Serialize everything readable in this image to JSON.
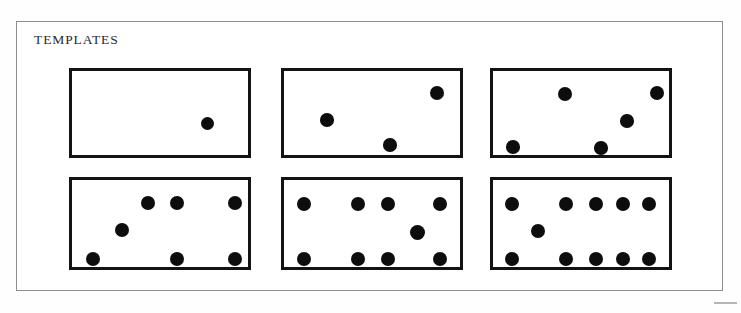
{
  "page": {
    "title": "TEMPLATES",
    "background_color": "#ffffff",
    "frame_color": "#8e8e8e",
    "card_border_color": "#131313",
    "dot_color": "#0d0d0d"
  },
  "templates": [
    {
      "id": "template-1",
      "name": "template-card-1-dot",
      "dot_count": "1",
      "rect": {
        "x": 69,
        "y": 68,
        "w": 182,
        "h": 90
      },
      "dots": [
        {
          "cx": 135,
          "cy": 52,
          "r": 6.5
        }
      ]
    },
    {
      "id": "template-2",
      "name": "template-card-3-dots",
      "dot_count": "3",
      "rect": {
        "x": 281,
        "y": 68,
        "w": 182,
        "h": 90
      },
      "dots": [
        {
          "cx": 153,
          "cy": 22,
          "r": 7.0
        },
        {
          "cx": 43,
          "cy": 49,
          "r": 6.8
        },
        {
          "cx": 106,
          "cy": 74,
          "r": 6.8
        }
      ]
    },
    {
      "id": "template-3",
      "name": "template-card-5-dots",
      "dot_count": "5",
      "rect": {
        "x": 490,
        "y": 68,
        "w": 182,
        "h": 90
      },
      "dots": [
        {
          "cx": 72,
          "cy": 23,
          "r": 7.0
        },
        {
          "cx": 164,
          "cy": 22,
          "r": 7.2
        },
        {
          "cx": 134,
          "cy": 50,
          "r": 6.8
        },
        {
          "cx": 20,
          "cy": 76,
          "r": 6.8
        },
        {
          "cx": 108,
          "cy": 77,
          "r": 6.8
        }
      ]
    },
    {
      "id": "template-4",
      "name": "template-card-7-dots",
      "dot_count": "7",
      "rect": {
        "x": 69,
        "y": 177,
        "w": 182,
        "h": 93
      },
      "dots": [
        {
          "cx": 76,
          "cy": 23,
          "r": 7.0
        },
        {
          "cx": 105,
          "cy": 23,
          "r": 7.0
        },
        {
          "cx": 163,
          "cy": 23,
          "r": 7.2
        },
        {
          "cx": 50,
          "cy": 50,
          "r": 7.0
        },
        {
          "cx": 21,
          "cy": 79,
          "r": 7.2
        },
        {
          "cx": 105,
          "cy": 79,
          "r": 7.0
        },
        {
          "cx": 163,
          "cy": 79,
          "r": 7.0
        }
      ]
    },
    {
      "id": "template-5",
      "name": "template-card-9-dots",
      "dot_count": "9",
      "rect": {
        "x": 281,
        "y": 177,
        "w": 182,
        "h": 93
      },
      "dots": [
        {
          "cx": 20,
          "cy": 24,
          "r": 7.2
        },
        {
          "cx": 74,
          "cy": 24,
          "r": 7.2
        },
        {
          "cx": 104,
          "cy": 24,
          "r": 7.2
        },
        {
          "cx": 156,
          "cy": 24,
          "r": 7.2
        },
        {
          "cx": 133,
          "cy": 52,
          "r": 7.5
        },
        {
          "cx": 20,
          "cy": 79,
          "r": 7.2
        },
        {
          "cx": 74,
          "cy": 79,
          "r": 7.2
        },
        {
          "cx": 104,
          "cy": 79,
          "r": 7.2
        },
        {
          "cx": 156,
          "cy": 79,
          "r": 7.2
        }
      ]
    },
    {
      "id": "template-6",
      "name": "template-card-11-dots",
      "dot_count": "11",
      "rect": {
        "x": 490,
        "y": 177,
        "w": 182,
        "h": 93
      },
      "dots": [
        {
          "cx": 19,
          "cy": 24,
          "r": 7.2
        },
        {
          "cx": 73,
          "cy": 24,
          "r": 7.2
        },
        {
          "cx": 103,
          "cy": 24,
          "r": 7.2
        },
        {
          "cx": 130,
          "cy": 24,
          "r": 7.2
        },
        {
          "cx": 156,
          "cy": 24,
          "r": 7.2
        },
        {
          "cx": 45,
          "cy": 51,
          "r": 7.2
        },
        {
          "cx": 19,
          "cy": 79,
          "r": 7.2
        },
        {
          "cx": 73,
          "cy": 79,
          "r": 7.2
        },
        {
          "cx": 103,
          "cy": 79,
          "r": 7.2
        },
        {
          "cx": 130,
          "cy": 79,
          "r": 7.2
        },
        {
          "cx": 156,
          "cy": 79,
          "r": 7.2
        }
      ]
    }
  ]
}
